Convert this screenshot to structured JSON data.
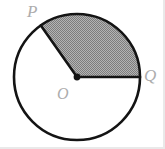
{
  "figure": {
    "type": "circle-sector-diagram",
    "background_color": "#ffffff",
    "stroke_color": "#141414",
    "shade_color": "#9a9a9a",
    "label_color": "#adadad",
    "circle": {
      "center_x": 77,
      "center_y": 77,
      "radius": 63,
      "stroke_width": 2.6
    },
    "center_point": {
      "name": "center-dot",
      "x": 77,
      "y": 77,
      "radius": 3.4
    },
    "sector": {
      "name": "shaded-sector",
      "start_angle_deg": 0,
      "end_angle_deg": 125,
      "fill": "hatched-gray",
      "description": "Shaded sector bounded by radius OQ and radius OP"
    },
    "radii": [
      {
        "name": "radius-OQ",
        "from": "O",
        "to": "Q",
        "angle_deg": 0
      },
      {
        "name": "radius-OP",
        "from": "O",
        "to": "P",
        "angle_deg": 125
      }
    ],
    "labels": [
      {
        "id": "P",
        "text": "P",
        "x": 27,
        "y": 3
      },
      {
        "id": "Q",
        "text": "Q",
        "x": 144,
        "y": 67
      },
      {
        "id": "O",
        "text": "O",
        "x": 57,
        "y": 86
      }
    ]
  }
}
